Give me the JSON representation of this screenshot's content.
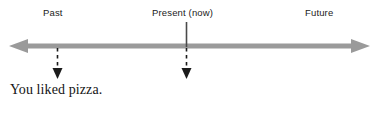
{
  "figure": {
    "name": "english-tense-timeline",
    "background_color": "#ffffff",
    "width": 379,
    "height": 116
  },
  "timeline": {
    "axis": {
      "name": "time-axis",
      "color": "#9a9a9a",
      "orientation": "horizontal",
      "double_headed": true,
      "y": 46,
      "x_start": 9,
      "x_end": 370,
      "thickness": 5
    },
    "labels": [
      {
        "id": "past",
        "text": "Past",
        "x": 43,
        "y": 7
      },
      {
        "id": "present",
        "text": "Present (now)",
        "x": 152,
        "y": 7
      },
      {
        "id": "future",
        "text": "Future",
        "x": 305,
        "y": 7
      }
    ],
    "markers": [
      {
        "id": "present-marker",
        "style": "solid",
        "color": "#4a4a4a",
        "x": 186,
        "y_top": 22,
        "y_bottom": 46,
        "arrowhead": false,
        "direction": "up-from-axis"
      }
    ],
    "event_pointers": [
      {
        "id": "past-event-pointer",
        "style": "dashed",
        "color": "#1b1b1b",
        "x": 57,
        "y_top": 48,
        "y_bottom": 78,
        "arrowhead": true,
        "direction": "down"
      },
      {
        "id": "present-event-pointer",
        "style": "dashed",
        "color": "#1b1b1b",
        "x": 186,
        "y_top": 48,
        "y_bottom": 78,
        "arrowhead": true,
        "direction": "down"
      }
    ],
    "caption": {
      "id": "event-caption",
      "text": "You liked pizza.",
      "x": 10,
      "y": 82,
      "color": "#141414"
    }
  },
  "colors": {
    "axis_gray": "#9a9a9a",
    "marker_dark": "#4a4a4a",
    "ink": "#1b1b1b",
    "background": "#ffffff"
  }
}
